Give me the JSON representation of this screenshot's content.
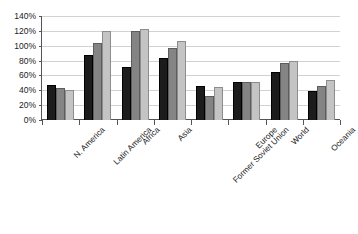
{
  "chart_data": {
    "type": "bar",
    "title": "",
    "subtitle": "",
    "xlabel": "",
    "ylabel": "",
    "ylim": [
      0,
      140
    ],
    "ytick_step": 20,
    "grid": true,
    "legend": "none",
    "orientation": "vertical",
    "grouping": "clustered",
    "categories": [
      "N. America",
      "Latin America",
      "Africa",
      "Asia",
      "Former Soviet Union",
      "Europe",
      "World",
      "Oceania"
    ],
    "ytick_labels": [
      "0%",
      "20%",
      "40%",
      "60%",
      "80%",
      "100%",
      "120%",
      "140%"
    ],
    "ytick_values": [
      0,
      20,
      40,
      60,
      80,
      100,
      120,
      140
    ],
    "series": [
      {
        "name": "series-1",
        "color": "#1c1c1c",
        "values": [
          47,
          87,
          72,
          83,
          46,
          51,
          65,
          39
        ]
      },
      {
        "name": "series-2",
        "color": "#848484",
        "values": [
          43,
          104,
          120,
          97,
          32,
          51,
          77,
          46
        ]
      },
      {
        "name": "series-3",
        "color": "#c4c4c4",
        "values": [
          40,
          120,
          122,
          106,
          44,
          51,
          80,
          54
        ]
      }
    ]
  },
  "axis": {
    "axis_color": "#555555",
    "grid_color": "#d2d2d2",
    "label_rotation_deg": -45
  }
}
